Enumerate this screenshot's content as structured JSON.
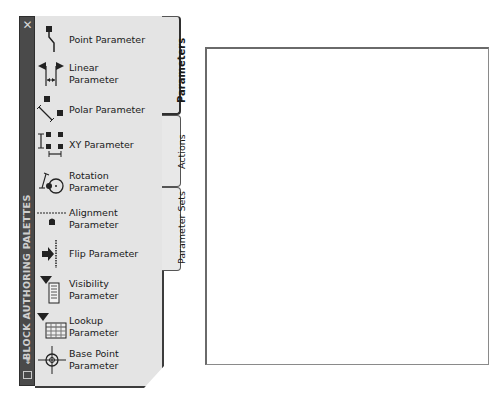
{
  "palette": {
    "title": "BLOCK AUTHORING PALETTES",
    "close_glyph": "✕",
    "properties_glyph": "⇟",
    "menu_glyph": "▤",
    "tabs": [
      {
        "label": "Parameters",
        "active": true
      },
      {
        "label": "Actions",
        "active": false
      },
      {
        "label": "Parameter Sets",
        "active": false
      }
    ],
    "items": [
      {
        "label": "Point Parameter",
        "icon": "point-parameter-icon"
      },
      {
        "label": "Linear Parameter",
        "icon": "linear-parameter-icon"
      },
      {
        "label": "Polar Parameter",
        "icon": "polar-parameter-icon"
      },
      {
        "label": "XY Parameter",
        "icon": "xy-parameter-icon"
      },
      {
        "label": "Rotation Parameter",
        "line1": "Rotation",
        "line2": "Parameter",
        "icon": "rotation-parameter-icon"
      },
      {
        "label": "Alignment Parameter",
        "line1": "Alignment",
        "line2": "Parameter",
        "icon": "alignment-parameter-icon"
      },
      {
        "label": "Flip Parameter",
        "icon": "flip-parameter-icon"
      },
      {
        "label": "Visibility Parameter",
        "line1": "Visibility",
        "line2": "Parameter",
        "icon": "visibility-parameter-icon"
      },
      {
        "label": "Lookup Parameter",
        "icon": "lookup-parameter-icon"
      },
      {
        "label": "Base Point Parameter",
        "line1": "Base Point",
        "line2": "Parameter",
        "icon": "base-point-parameter-icon"
      }
    ]
  },
  "colors": {
    "bar": "#4a4a4a",
    "panel": "#e4e4e4",
    "border": "#3c3c3c",
    "icon": "#222222"
  }
}
